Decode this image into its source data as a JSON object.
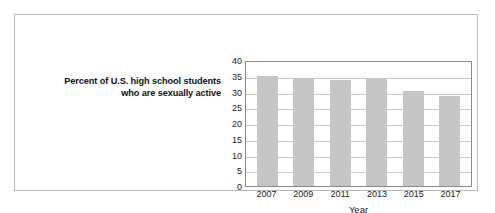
{
  "caption": {
    "line1": "Percent of U.S. high school students",
    "line2": "who are sexually active"
  },
  "chart_data": {
    "type": "bar",
    "title": "Percent of U.S. high school students who are sexually active",
    "xlabel": "Year",
    "ylabel": "",
    "categories": [
      "2007",
      "2009",
      "2011",
      "2013",
      "2015",
      "2017"
    ],
    "values": [
      35.0,
      34.2,
      33.7,
      34.0,
      30.1,
      28.6
    ],
    "ylim": [
      0,
      40
    ],
    "yticks": [
      40,
      35,
      30,
      25,
      20,
      15,
      10,
      5,
      0
    ],
    "ytick_labels": [
      "40",
      "35",
      "30",
      "25",
      "20",
      "15",
      "10",
      "5",
      "0"
    ],
    "grid": true,
    "legend": false,
    "bar_color": "#c6c6c6",
    "axis_color": "#8a8a8a",
    "grid_color": "#c9c9c9",
    "frame_color": "#b9b9b9"
  }
}
